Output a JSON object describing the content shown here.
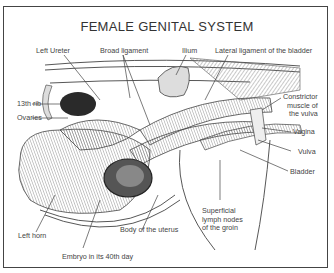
{
  "title": "FEMALE GENITAL SYSTEM",
  "labels": {
    "left_ureter": "Left Ureter",
    "broad_ligament": "Broad ligament",
    "ilium": "Ilium",
    "lateral_ligament": "Lateral ligament of the bladder",
    "rib13": "13th rib",
    "ovaries": "Ovaries",
    "constrictor_1": "Constrictor",
    "constrictor_2": "muscle of",
    "constrictor_3": "the vulva",
    "vagina": "Vagina",
    "vulva": "Vulva",
    "bladder": "Bladder",
    "superficial_1": "Superficial",
    "superficial_2": "lymph nodes",
    "superficial_3": "of the groin",
    "body_uterus": "Body of the uterus",
    "left_horn": "Left horn",
    "embryo": "Embryo in its 40th day"
  }
}
